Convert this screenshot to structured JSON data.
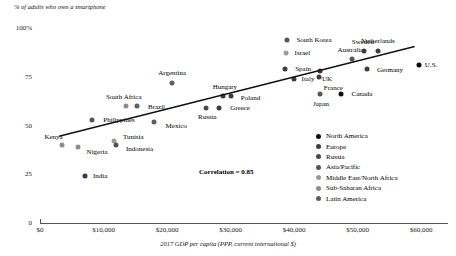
{
  "chart_data": {
    "type": "scatter",
    "title": "",
    "ylabel": "% of adults who own a smartphone",
    "xlabel": "2017 GDP per capita (PPP, current international $)",
    "xlim": [
      0,
      60000
    ],
    "ylim": [
      0,
      100
    ],
    "grid": false,
    "annotation": "Correlation = 0.85",
    "xticks": [
      "$0",
      "$10,000",
      "$20,000",
      "$30,000",
      "$40,000",
      "$50,000",
      "$60,000"
    ],
    "xtick_values": [
      0,
      10000,
      20000,
      30000,
      40000,
      50000,
      60000
    ],
    "yticks": [
      "100%",
      "75",
      "50",
      "25",
      "0"
    ],
    "ytick_values": [
      100,
      75,
      50,
      25,
      0
    ],
    "trendline": {
      "x0": 3000,
      "y0": 44.5,
      "x1": 59000,
      "y1": 90.5
    },
    "legend_position": "inside-right",
    "legend": [
      {
        "label": "North America",
        "color": "#0d0d0d"
      },
      {
        "label": "Europe",
        "color": "#3d3d3d"
      },
      {
        "label": "Russia",
        "color": "#4a4a4a"
      },
      {
        "label": "Asia/Pacific",
        "color": "#555555"
      },
      {
        "label": "Middle East/North Africa",
        "color": "#9a9a9a"
      },
      {
        "label": "Sub-Saharan Africa",
        "color": "#8c8c8c"
      },
      {
        "label": "Latin America",
        "color": "#5e5e5e"
      }
    ],
    "points": [
      {
        "name": "Kenya",
        "x": 3400,
        "y": 40,
        "color": "#8c8c8c",
        "label_dx": -8,
        "label_dy": -8
      },
      {
        "name": "Nigeria",
        "x": 6000,
        "y": 39,
        "color": "#8c8c8c",
        "label_dx": 19,
        "label_dy": 5
      },
      {
        "name": "India",
        "x": 7100,
        "y": 24,
        "color": "#3d3d3d",
        "label_dx": 15,
        "label_dy": 0
      },
      {
        "name": "Tunisia",
        "x": 11700,
        "y": 42,
        "color": "#9a9a9a",
        "label_dx": 19,
        "label_dy": -4
      },
      {
        "name": "Indonesia",
        "x": 11900,
        "y": 40,
        "color": "#555555",
        "label_dx": 24,
        "label_dy": 4
      },
      {
        "name": "Philippines",
        "x": 8200,
        "y": 53,
        "color": "#555555",
        "label_dx": 27,
        "label_dy": 0
      },
      {
        "name": "South Africa",
        "x": 13500,
        "y": 60,
        "color": "#8c8c8c",
        "label_dx": -2,
        "label_dy": -9
      },
      {
        "name": "Brazil",
        "x": 15200,
        "y": 60,
        "color": "#5e5e5e",
        "label_dx": 20,
        "label_dy": 1
      },
      {
        "name": "Mexico",
        "x": 18000,
        "y": 52,
        "color": "#5e5e5e",
        "label_dx": 22,
        "label_dy": 4
      },
      {
        "name": "Russia",
        "x": 26200,
        "y": 59,
        "color": "#4a4a4a",
        "label_dx": 1,
        "label_dy": 9
      },
      {
        "name": "Greece",
        "x": 28200,
        "y": 59,
        "color": "#3d3d3d",
        "label_dx": 21,
        "label_dy": 0
      },
      {
        "name": "Argentina",
        "x": 20800,
        "y": 72,
        "color": "#5e5e5e",
        "label_dx": 0,
        "label_dy": -10
      },
      {
        "name": "Hungary",
        "x": 28800,
        "y": 65,
        "color": "#3d3d3d",
        "label_dx": 2,
        "label_dy": -9
      },
      {
        "name": "Poland",
        "x": 30000,
        "y": 65,
        "color": "#3d3d3d",
        "label_dx": 20,
        "label_dy": 2
      },
      {
        "name": "Spain",
        "x": 38600,
        "y": 79,
        "color": "#3d3d3d",
        "label_dx": 18,
        "label_dy": 0
      },
      {
        "name": "Israel",
        "x": 38800,
        "y": 87,
        "color": "#9a9a9a",
        "label_dx": 16,
        "label_dy": 0
      },
      {
        "name": "South Korea",
        "x": 38900,
        "y": 94,
        "color": "#555555",
        "label_dx": 27,
        "label_dy": 0
      },
      {
        "name": "Italy",
        "x": 40000,
        "y": 74,
        "color": "#3d3d3d",
        "label_dx": 14,
        "label_dy": 0
      },
      {
        "name": "UK",
        "x": 44100,
        "y": 78,
        "color": "#3d3d3d",
        "label_dx": 7,
        "label_dy": 8
      },
      {
        "name": "France",
        "x": 44000,
        "y": 75,
        "color": "#3d3d3d",
        "label_dx": 14,
        "label_dy": 11
      },
      {
        "name": "Japan",
        "x": 44100,
        "y": 66,
        "color": "#555555",
        "label_dx": 1,
        "label_dy": 10
      },
      {
        "name": "Canada",
        "x": 47400,
        "y": 66,
        "color": "#0d0d0d",
        "label_dx": 21,
        "label_dy": 0
      },
      {
        "name": "Australia",
        "x": 49200,
        "y": 84,
        "color": "#555555",
        "label_dx": -2,
        "label_dy": -9
      },
      {
        "name": "Sweden",
        "x": 51000,
        "y": 88,
        "color": "#3d3d3d",
        "label_dx": -1,
        "label_dy": -9
      },
      {
        "name": "Germany",
        "x": 51500,
        "y": 79,
        "color": "#3d3d3d",
        "label_dx": 23,
        "label_dy": 1
      },
      {
        "name": "Netherlands",
        "x": 53200,
        "y": 88,
        "color": "#3d3d3d",
        "label_dx": 0,
        "label_dy": -10
      },
      {
        "name": "U.S.",
        "x": 59700,
        "y": 81,
        "color": "#0d0d0d",
        "label_dx": 12,
        "label_dy": 0
      }
    ]
  }
}
